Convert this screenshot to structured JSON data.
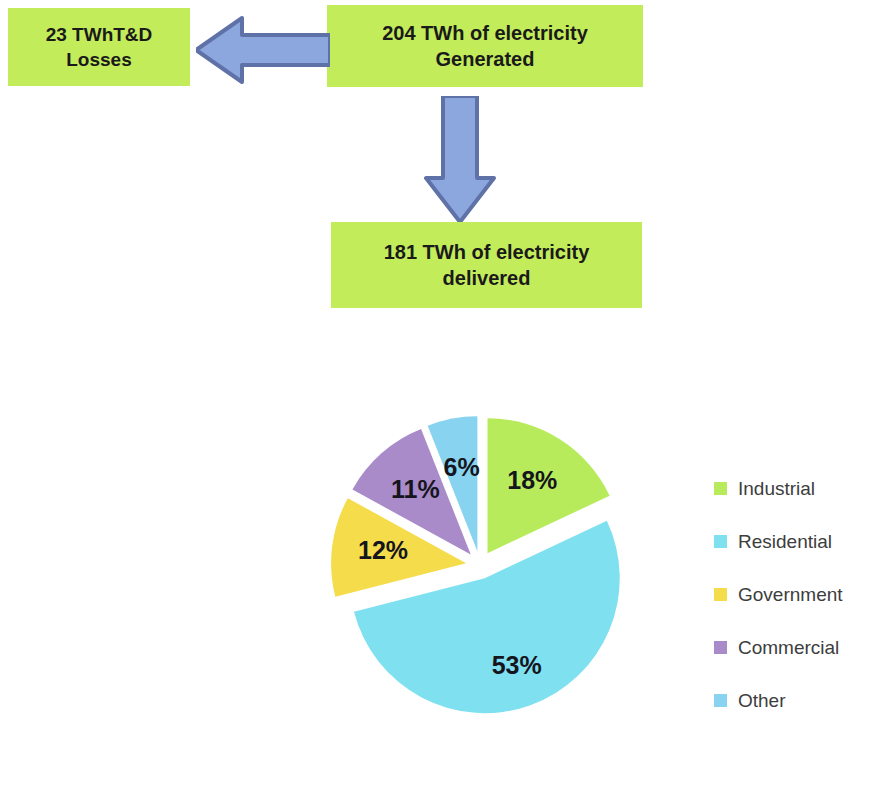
{
  "diagram": {
    "boxes": [
      {
        "id": "losses",
        "text": "23 TWhT&D\nLosses",
        "color": "#c3ec5a"
      },
      {
        "id": "generated",
        "text": "204 TWh of electricity\nGenerated",
        "color": "#c3ec5a"
      },
      {
        "id": "delivered",
        "text": "181 TWh of electricity\ndelivered",
        "color": "#c3ec5a"
      }
    ],
    "arrows": [
      {
        "id": "left-arrow",
        "direction": "left",
        "fill": "#8ca6de",
        "stroke": "#5f72a8"
      },
      {
        "id": "down-arrow",
        "direction": "down",
        "fill": "#8ca6de",
        "stroke": "#5f72a8"
      }
    ]
  },
  "chart_data": {
    "type": "pie",
    "title": "",
    "exploded": true,
    "start_angle_deg": 0,
    "direction": "clockwise",
    "legend_position": "right",
    "categories": [
      "Industrial",
      "Residential",
      "Government",
      "Commercial",
      "Other"
    ],
    "values": [
      18,
      53,
      12,
      11,
      6
    ],
    "labels": [
      "18%",
      "53%",
      "12%",
      "11%",
      "6%"
    ],
    "colors": [
      "#b8eb5c",
      "#7fe1f0",
      "#f5dc4a",
      "#a98bc9",
      "#88d3ef"
    ],
    "units": "percent"
  },
  "legend": {
    "items": [
      {
        "label": "Industrial",
        "color": "#b8eb5c"
      },
      {
        "label": "Residential",
        "color": "#7fe1f0"
      },
      {
        "label": "Government",
        "color": "#f5dc4a"
      },
      {
        "label": "Commercial",
        "color": "#a98bc9"
      },
      {
        "label": "Other",
        "color": "#88d3ef"
      }
    ]
  }
}
